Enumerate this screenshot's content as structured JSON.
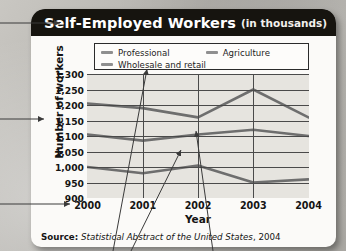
{
  "card": {
    "title_main": "Self-Employed Workers",
    "title_sub": "(in thousands)"
  },
  "source": {
    "label": "Source:",
    "title": "Statistical Abstract of the United States",
    "year": ", 2004"
  },
  "legend": {
    "items": [
      {
        "label": "Professional",
        "color": "#8f8f8f"
      },
      {
        "label": "Agriculture",
        "color": "#8f8f8f"
      },
      {
        "label": "Wholesale and retail",
        "color": "#8f8f8f"
      }
    ]
  },
  "axis": {
    "y_title": "Number of workers",
    "x_title": "Year"
  },
  "chart_data": {
    "type": "line",
    "title": "Self-Employed Workers (in thousands)",
    "xlabel": "Year",
    "ylabel": "Number of workers",
    "categories": [
      "2000",
      "2001",
      "2002",
      "2003",
      "2004"
    ],
    "x": [
      2000,
      2001,
      2002,
      2003,
      2004
    ],
    "ylim": [
      900,
      1300
    ],
    "yticks": [
      "1,300",
      "1,250",
      "1,200",
      "1,150",
      "1,100",
      "1,050",
      "1,000",
      "950",
      "900"
    ],
    "ytick_values": [
      1300,
      1250,
      1200,
      1150,
      1100,
      1050,
      1000,
      950,
      900
    ],
    "grid": true,
    "legend_position": "top",
    "series": [
      {
        "name": "Professional",
        "color": "#6e6e6e",
        "values": [
          1205,
          1190,
          1160,
          1250,
          1160
        ]
      },
      {
        "name": "Wholesale and retail",
        "color": "#6e6e6e",
        "values": [
          1105,
          1085,
          1105,
          1120,
          1100
        ]
      },
      {
        "name": "Agriculture",
        "color": "#6e6e6e",
        "values": [
          1000,
          980,
          1005,
          950,
          960
        ]
      }
    ],
    "source": "Statistical Abstract of the United States, 2004"
  }
}
